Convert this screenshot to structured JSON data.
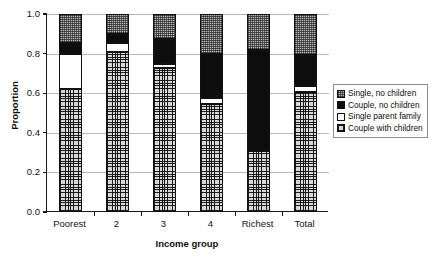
{
  "chart_data": {
    "type": "bar",
    "subtype": "stacked-100-percent",
    "title": "",
    "xlabel": "Income group",
    "ylabel": "Proportion",
    "categories": [
      "Poorest",
      "2",
      "3",
      "4",
      "Richest",
      "Total"
    ],
    "ylim": [
      0.0,
      1.0
    ],
    "yticks": [
      "0.0",
      "0.2",
      "0.4",
      "0.6",
      "0.8",
      "1.0"
    ],
    "ytick_values": [
      0.0,
      0.2,
      0.4,
      0.6,
      0.8,
      1.0
    ],
    "grid": true,
    "legend_position": "right",
    "series": [
      {
        "name": "Single, no children",
        "pattern": "dotted-gray",
        "color": "#b3b3b3",
        "values": [
          0.145,
          0.1,
          0.125,
          0.2,
          0.18,
          0.205
        ]
      },
      {
        "name": "Couple, no children",
        "pattern": "solid-black",
        "color": "#0d0d0d",
        "values": [
          0.055,
          0.045,
          0.125,
          0.225,
          0.51,
          0.16
        ]
      },
      {
        "name": "Single parent family",
        "pattern": "white",
        "color": "#ffffff",
        "values": [
          0.18,
          0.045,
          0.025,
          0.03,
          0.0,
          0.03
        ]
      },
      {
        "name": "Couple with children",
        "pattern": "crosshatch",
        "color": "#d6d6d6",
        "values": [
          0.62,
          0.81,
          0.725,
          0.545,
          0.31,
          0.605
        ]
      }
    ],
    "stack_order_bottom_to_top": [
      "Couple with children",
      "Single parent family",
      "Couple, no children",
      "Single, no children"
    ]
  },
  "legend": {
    "items": [
      {
        "label": "Single, no children",
        "fill_class": "fill-single-no-children"
      },
      {
        "label": "Couple, no children",
        "fill_class": "fill-couple-no-children"
      },
      {
        "label": "Single parent family",
        "fill_class": "fill-single-parent-family"
      },
      {
        "label": "Couple with children",
        "fill_class": "fill-couple-with-children"
      }
    ]
  }
}
